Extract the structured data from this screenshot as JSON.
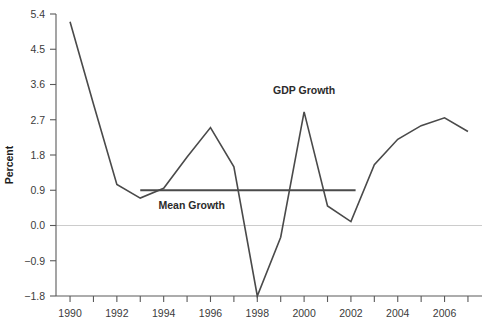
{
  "chart_data": {
    "type": "line",
    "title": "",
    "xlabel": "",
    "ylabel": "Percent",
    "xlim": [
      1989.4,
      2007.6
    ],
    "ylim": [
      -1.8,
      5.4
    ],
    "grid": false,
    "legend": "inline-annotations",
    "x": [
      1990,
      1991,
      1992,
      1993,
      1994,
      1995,
      1996,
      1997,
      1998,
      1999,
      2000,
      2001,
      2002,
      2003,
      2004,
      2005,
      2006,
      2007
    ],
    "series": [
      {
        "name": "GDP Growth",
        "values": [
          5.2,
          3.1,
          1.05,
          0.7,
          0.95,
          1.75,
          2.5,
          1.5,
          -1.8,
          -0.3,
          2.9,
          0.5,
          0.1,
          1.55,
          2.2,
          2.55,
          2.75,
          2.4
        ]
      },
      {
        "name": "Mean Growth",
        "constant_value": 0.9,
        "x_start": 1993,
        "x_end": 2002.2
      }
    ],
    "y_ticks": [
      -1.8,
      -0.9,
      0.0,
      0.9,
      1.8,
      2.7,
      3.6,
      4.5,
      5.4
    ],
    "y_tick_labels": [
      "−1.8",
      "−0.9",
      "0.0",
      "0.9",
      "1.8",
      "2.7",
      "3.6",
      "4.5",
      "5.4"
    ],
    "x_ticks": [
      1990,
      1991,
      1992,
      1993,
      1994,
      1995,
      1996,
      1997,
      1998,
      1999,
      2000,
      2001,
      2002,
      2003,
      2004,
      2005,
      2006,
      2007
    ],
    "x_tick_labels_shown": [
      1990,
      1992,
      1994,
      1996,
      1998,
      2000,
      2002,
      2004,
      2006
    ],
    "x_tick_label_text": [
      "1990",
      "1992",
      "1994",
      "1996",
      "1998",
      "2000",
      "2002",
      "2004",
      "2006"
    ],
    "annotations": [
      {
        "text": "GDP Growth",
        "x": 2000,
        "y": 3.35
      },
      {
        "text": "Mean Growth",
        "x": 1995.2,
        "y": 0.42
      }
    ],
    "reference_lines": [
      {
        "name": "zero",
        "value": 0.0,
        "color": "#cccccc"
      }
    ],
    "colors": {
      "series": "#4a4a4a",
      "axis": "#5a5a5a",
      "zero_reference": "#cccccc",
      "text": "#2b2b2b",
      "background": "#ffffff"
    }
  },
  "axis": {
    "y_title": "Percent"
  }
}
